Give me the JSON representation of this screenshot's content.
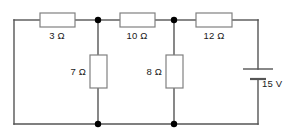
{
  "diagram": {
    "type": "electrical-circuit-schematic",
    "style": {
      "wire_color": "#555555",
      "component_stroke": "#808080",
      "component_fill": "#ffffff",
      "node_color": "#000000",
      "label_color": "#1a1a1a",
      "background": "#ffffff"
    },
    "components": [
      {
        "id": "r3",
        "kind": "resistor",
        "orientation": "horizontal",
        "label": "3 Ω",
        "value": 3,
        "unit": "Ω",
        "branch": "top-left"
      },
      {
        "id": "r10",
        "kind": "resistor",
        "orientation": "horizontal",
        "label": "10 Ω",
        "value": 10,
        "unit": "Ω",
        "branch": "top-middle"
      },
      {
        "id": "r12",
        "kind": "resistor",
        "orientation": "horizontal",
        "label": "12 Ω",
        "value": 12,
        "unit": "Ω",
        "branch": "top-right"
      },
      {
        "id": "r7",
        "kind": "resistor",
        "orientation": "vertical",
        "label": "7 Ω",
        "value": 7,
        "unit": "Ω",
        "branch": "shunt-left"
      },
      {
        "id": "r8",
        "kind": "resistor",
        "orientation": "vertical",
        "label": "8 Ω",
        "value": 8,
        "unit": "Ω",
        "branch": "shunt-right"
      },
      {
        "id": "battery",
        "kind": "battery",
        "orientation": "vertical",
        "label": "15 V",
        "value": 15,
        "unit": "V",
        "branch": "right-side"
      }
    ],
    "nodes": [
      {
        "id": "node-top-left",
        "x": 98,
        "y": 20
      },
      {
        "id": "node-top-right",
        "x": 174,
        "y": 20
      },
      {
        "id": "node-bottom-left",
        "x": 98,
        "y": 124
      },
      {
        "id": "node-bottom-right",
        "x": 174,
        "y": 124
      }
    ]
  }
}
